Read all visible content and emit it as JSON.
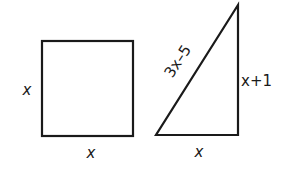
{
  "diagram": {
    "square": {
      "left_side_label": "x",
      "bottom_side_label": "x"
    },
    "triangle": {
      "hypotenuse_label": "3x–5",
      "vertical_side_label": "x+1",
      "base_label": "x"
    }
  }
}
